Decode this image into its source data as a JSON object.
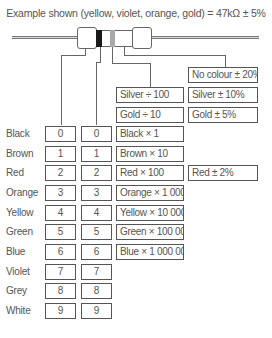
{
  "title": "Example shown (yellow, violet, orange, gold) = 47kΩ ± 5%",
  "resistor": {
    "bands": [
      {
        "name": "first-band",
        "color": "#1a1a1a"
      },
      {
        "name": "second-band",
        "color": "#ffffff"
      },
      {
        "name": "multiplier-band",
        "color": "#a9a9a9"
      },
      {
        "name": "tolerance-band",
        "color": "#ffffff"
      }
    ]
  },
  "special_multipliers": [
    {
      "label": "Silver ÷ 100"
    },
    {
      "label": "Gold ÷ 10"
    }
  ],
  "tolerances_top": [
    {
      "label": "No colour ± 20%"
    },
    {
      "label": "Silver ± 10%"
    },
    {
      "label": "Gold ± 5%"
    }
  ],
  "rows": [
    {
      "colour": "Black",
      "digit1": "0",
      "digit2": "0",
      "multiplier": "Black × 1",
      "tolerance": null
    },
    {
      "colour": "Brown",
      "digit1": "1",
      "digit2": "1",
      "multiplier": "Brown × 10",
      "tolerance": null
    },
    {
      "colour": "Red",
      "digit1": "2",
      "digit2": "2",
      "multiplier": "Red × 100",
      "tolerance": "Red ± 2%"
    },
    {
      "colour": "Orange",
      "digit1": "3",
      "digit2": "3",
      "multiplier": "Orange × 1 000",
      "tolerance": null
    },
    {
      "colour": "Yellow",
      "digit1": "4",
      "digit2": "4",
      "multiplier": "Yellow × 10 000",
      "tolerance": null
    },
    {
      "colour": "Green",
      "digit1": "5",
      "digit2": "5",
      "multiplier": "Green × 100 000",
      "tolerance": null
    },
    {
      "colour": "Blue",
      "digit1": "6",
      "digit2": "6",
      "multiplier": "Blue × 1 000 000",
      "tolerance": null
    },
    {
      "colour": "Violet",
      "digit1": "7",
      "digit2": "7",
      "multiplier": null,
      "tolerance": null
    },
    {
      "colour": "Grey",
      "digit1": "8",
      "digit2": "8",
      "multiplier": null,
      "tolerance": null
    },
    {
      "colour": "White",
      "digit1": "9",
      "digit2": "9",
      "multiplier": null,
      "tolerance": null
    }
  ]
}
